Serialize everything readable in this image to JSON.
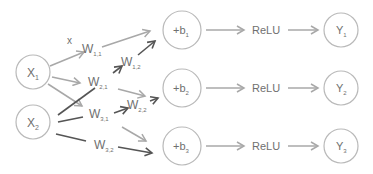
{
  "diagram": {
    "inputs": [
      {
        "id": "x1",
        "label": "X",
        "sub": "1",
        "cx": 33,
        "cy": 72
      },
      {
        "id": "x2",
        "label": "X",
        "sub": "2",
        "cx": 33,
        "cy": 122
      }
    ],
    "bias_nodes": [
      {
        "id": "b1",
        "label": "+b",
        "sub": "1",
        "cx": 182,
        "cy": 30
      },
      {
        "id": "b2",
        "label": "+b",
        "sub": "2",
        "cx": 182,
        "cy": 88
      },
      {
        "id": "b3",
        "label": "+b",
        "sub": "3",
        "cx": 182,
        "cy": 146
      }
    ],
    "activation_label": "ReLU",
    "outputs": [
      {
        "id": "y1",
        "label": "Y",
        "sub": "1",
        "cx": 341,
        "cy": 30
      },
      {
        "id": "y2",
        "label": "Y",
        "sub": "2",
        "cx": 341,
        "cy": 88
      },
      {
        "id": "y3",
        "label": "Y",
        "sub": "3",
        "cx": 341,
        "cy": 146
      }
    ],
    "multiply_symbol": "x",
    "weights": [
      {
        "label": "W",
        "sub": "1,1"
      },
      {
        "label": "W",
        "sub": "1,2"
      },
      {
        "label": "W",
        "sub": "2,1"
      },
      {
        "label": "W",
        "sub": "2,2"
      },
      {
        "label": "W",
        "sub": "3,1"
      },
      {
        "label": "W",
        "sub": "3,2"
      }
    ],
    "colors": {
      "node_stroke": "#b9b9b9",
      "text": "#6f6f6f",
      "light_arrow": "#a8a8a8",
      "dark_arrow": "#555555"
    }
  }
}
